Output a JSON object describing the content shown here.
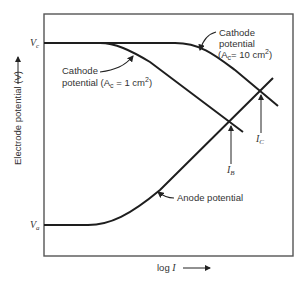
{
  "diagram": {
    "y_axis": {
      "label": "Electrode potential (V)",
      "arrow": "up-arrow"
    },
    "x_axis": {
      "label": "log I",
      "arrow": "right-arrow"
    },
    "levels": {
      "cathode_level": {
        "symbol": "V",
        "subscript": "c"
      },
      "anode_level": {
        "symbol": "V",
        "subscript": "a"
      }
    },
    "curves": [
      {
        "id": "cathode-1",
        "label_line1": "Cathode",
        "label_line2": "potential (A",
        "area_sub": "c",
        "area_value": " = 1 cm",
        "sup": "2",
        "close": ")"
      },
      {
        "id": "cathode-10",
        "label_line1": "Cathode",
        "label_line2": "potential",
        "label_line3_a": "(A",
        "area_sub": "c",
        "area_value": "= 10 cm",
        "sup": "2",
        "close": ")"
      },
      {
        "id": "anode",
        "label": "Anode potential"
      }
    ],
    "intersections": [
      {
        "symbol": "I",
        "subscript": "B"
      },
      {
        "symbol": "I",
        "subscript": "C"
      }
    ]
  },
  "colors": {
    "line": "#1e1e1e",
    "frame": "#555555",
    "text": "#333333"
  }
}
